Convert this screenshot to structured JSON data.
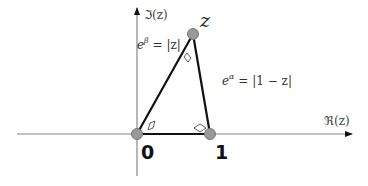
{
  "diagram": {
    "axes": {
      "real_label": "ℜ(z)",
      "imag_label": "ℑ(z)",
      "color": "#888888"
    },
    "points": [
      {
        "name": "origin",
        "label": "0",
        "x": 137,
        "y": 134
      },
      {
        "name": "one",
        "label": "1",
        "x": 210,
        "y": 134
      },
      {
        "name": "z",
        "label": "z",
        "x": 193,
        "y": 34
      }
    ],
    "edges": [
      {
        "from": "origin",
        "to": "z",
        "label_base": "e",
        "label_exp": "β",
        "label_rest": " = |z|"
      },
      {
        "from": "z",
        "to": "one",
        "label_base": "e",
        "label_exp": "α",
        "label_rest": " = |1 − z|"
      },
      {
        "from": "origin",
        "to": "one"
      }
    ],
    "angle_markers": [
      {
        "at": "origin",
        "shape": "parallelogram"
      },
      {
        "at": "one",
        "shape": "rhombus"
      },
      {
        "at": "z",
        "shape": "parallelogram"
      }
    ],
    "colors": {
      "point_fill": "#999999",
      "point_stroke": "#777777",
      "edge": "#111111",
      "axis": "#888888"
    }
  }
}
